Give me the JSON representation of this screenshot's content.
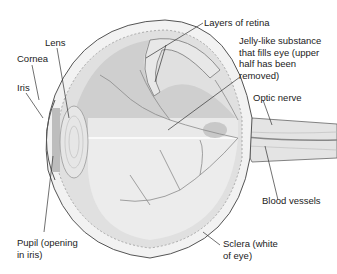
{
  "diagram": {
    "labels": {
      "lens": "Lens",
      "cornea": "Cornea",
      "iris": "Iris",
      "layers_of_retina": "Layers of retina",
      "vitreous": "Jelly-like substance\nthat fills eye (upper\nhalf has been\nremoved)",
      "optic_nerve": "Optic nerve",
      "blood_vessels": "Blood vessels",
      "pupil": "Pupil (opening\nin iris)",
      "sclera": "Sclera (white\nof eye)"
    },
    "colors": {
      "background": "#ffffff",
      "outline": "#555555",
      "fill_light": "#efefef",
      "fill_mid": "#d6d6d6",
      "fill_dark": "#bdbdbd",
      "vessels": "#8a8a8a",
      "leader_lines": "#333333"
    }
  }
}
